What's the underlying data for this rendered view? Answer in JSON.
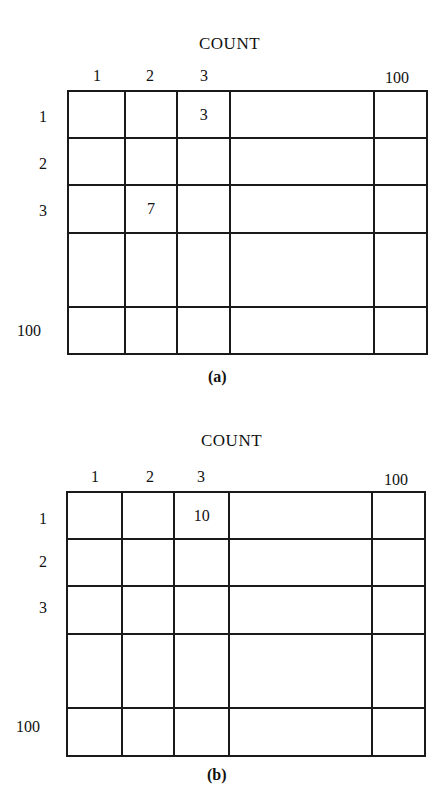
{
  "figures": [
    {
      "title": "COUNT",
      "caption": "(a)",
      "column_labels": [
        "1",
        "2",
        "3",
        "",
        "100"
      ],
      "row_labels": [
        "1",
        "2",
        "3",
        "",
        "100"
      ],
      "cells": [
        [
          "",
          "",
          "3",
          "",
          ""
        ],
        [
          "",
          "",
          "",
          "",
          ""
        ],
        [
          "",
          "7",
          "",
          "",
          ""
        ],
        [
          "",
          "",
          "",
          "",
          ""
        ],
        [
          "",
          "",
          "",
          "",
          ""
        ]
      ]
    },
    {
      "title": "COUNT",
      "caption": "(b)",
      "column_labels": [
        "1",
        "2",
        "3",
        "",
        "100"
      ],
      "row_labels": [
        "1",
        "2",
        "3",
        "",
        "100"
      ],
      "cells": [
        [
          "",
          "",
          "10",
          "",
          ""
        ],
        [
          "",
          "",
          "",
          "",
          ""
        ],
        [
          "",
          "",
          "",
          "",
          ""
        ],
        [
          "",
          "",
          "",
          "",
          ""
        ],
        [
          "",
          "",
          "",
          "",
          ""
        ]
      ]
    }
  ]
}
